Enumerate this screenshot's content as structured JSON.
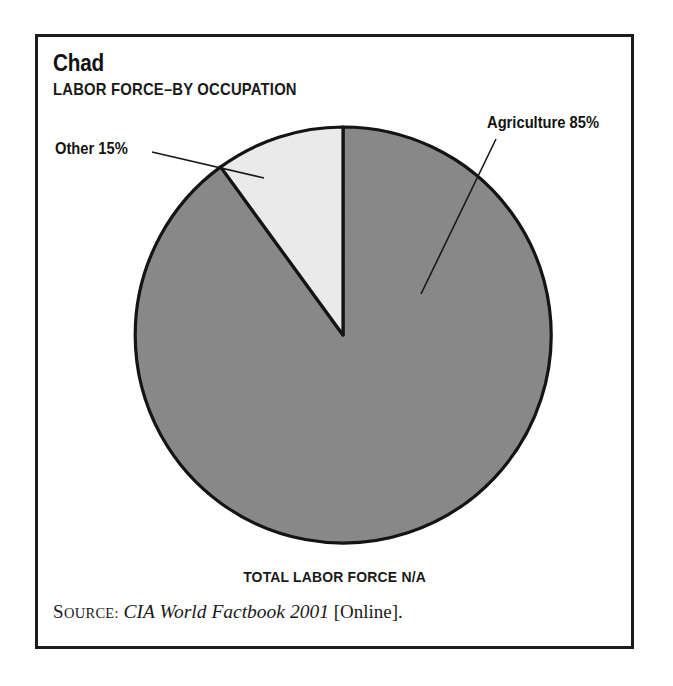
{
  "figure": {
    "country": "Chad",
    "subtitle": "LABOR FORCE–BY OCCUPATION",
    "total_label": "TOTAL LABOR FORCE N/A",
    "source_prefix": "SOURCE:",
    "source_title": "CIA World Factbook 2001",
    "source_suffix": "[Online].",
    "frame_color": "#1b1b1b",
    "background": "#ffffff"
  },
  "chart_data": {
    "type": "pie",
    "title": "Chad",
    "subtitle": "LABOR FORCE–BY OCCUPATION",
    "categories": [
      "Agriculture",
      "Other"
    ],
    "values": [
      85,
      15
    ],
    "unit": "percent",
    "labels": [
      "Agriculture 85%",
      "Other 15%"
    ],
    "slice_colors": [
      "#8b8b8b",
      "#ededed"
    ],
    "slice_outline": "#141414",
    "start_angle_deg": 0,
    "direction": "agriculture-clockwise-from-top, other-counterclockwise-from-top",
    "legend": "none",
    "grid": false,
    "annotations": [
      {
        "text": "Agriculture 85%",
        "slice": "Agriculture",
        "leader": true
      },
      {
        "text": "Other 15%",
        "slice": "Other",
        "leader": true
      }
    ],
    "footer": "TOTAL LABOR FORCE N/A",
    "source": "CIA World Factbook 2001 [Online]."
  }
}
